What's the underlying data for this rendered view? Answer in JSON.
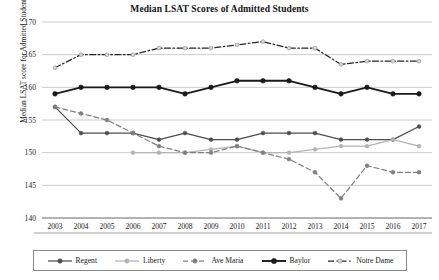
{
  "chart_data": {
    "type": "line",
    "title": "Median LSAT Scores of Admitted Students",
    "xlabel": "",
    "ylabel": "Median LSAT score for Admitted Students",
    "categories": [
      "2003",
      "2004",
      "2005",
      "2006",
      "2007",
      "2008",
      "2009",
      "2010",
      "2011",
      "2012",
      "2013",
      "2014",
      "2015",
      "2016",
      "2017"
    ],
    "ylim": [
      140,
      170
    ],
    "yticks": [
      140,
      145,
      150,
      155,
      160,
      165,
      170
    ],
    "grid": true,
    "legend_position": "bottom",
    "series": [
      {
        "name": "Regent",
        "color": "#4d4d4d",
        "style": "solid",
        "marker": "circle",
        "values": [
          157,
          153,
          153,
          153,
          152,
          153,
          152,
          152,
          153,
          153,
          153,
          152,
          152,
          152,
          154
        ]
      },
      {
        "name": "Liberty",
        "color": "#b3b3b3",
        "style": "solid",
        "marker": "circle",
        "values": [
          null,
          null,
          null,
          150,
          150,
          150,
          150.5,
          151,
          150,
          150,
          150.5,
          151,
          151,
          152,
          151
        ]
      },
      {
        "name": "Ave Maria",
        "color": "#808080",
        "style": "dashed",
        "marker": "circle",
        "values": [
          157,
          156,
          155,
          153,
          151,
          150,
          150,
          151,
          150,
          149,
          147,
          143,
          148,
          147,
          147
        ]
      },
      {
        "name": "Baylor",
        "color": "#1a1a1a",
        "style": "solid-thick",
        "marker": "circle-large",
        "values": [
          159,
          160,
          160,
          160,
          160,
          159,
          160,
          161,
          161,
          161,
          160,
          159,
          160,
          159,
          159
        ]
      },
      {
        "name": "Notre Dame",
        "color": "#262626",
        "style": "dashdot",
        "marker": "circle-light",
        "values": [
          163,
          165,
          165,
          165,
          166,
          166,
          166,
          166.5,
          167,
          166,
          166,
          163.5,
          164,
          164,
          164
        ]
      }
    ]
  },
  "legend": {
    "items": [
      {
        "label": "Regent"
      },
      {
        "label": "Liberty"
      },
      {
        "label": "Ave Maria"
      },
      {
        "label": "Baylor"
      },
      {
        "label": "Notre Dame"
      }
    ]
  }
}
